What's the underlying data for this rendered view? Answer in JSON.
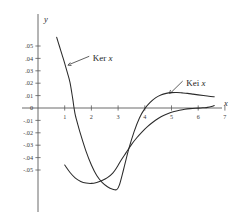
{
  "chart_data": {
    "type": "line",
    "title": "",
    "xlabel": "x",
    "ylabel": "y",
    "xlim": [
      0,
      7.6
    ],
    "ylim": [
      -0.068,
      0.062
    ],
    "grid": false,
    "legend": "annotations-with-arrows",
    "xticks": [
      1,
      2,
      3,
      4,
      5,
      6,
      7
    ],
    "xtick_labels": [
      "1",
      "2",
      "3",
      "4",
      "5",
      "6",
      "7"
    ],
    "yticks": [
      0.05,
      0.04,
      0.03,
      0.02,
      0.01,
      0,
      -0.01,
      -0.02,
      -0.03,
      -0.04,
      -0.05
    ],
    "ytick_labels": [
      ".05",
      ".04",
      ".03",
      ".02",
      ".01",
      "0",
      "-.01",
      "-.02",
      "-.03",
      "-.04",
      "-.05"
    ],
    "annotations": [
      {
        "text": "Ker x",
        "label_x": 2.05,
        "label_y": 0.0405,
        "arrow_to_x": 1.12,
        "arrow_to_y": 0.0345
      },
      {
        "text": "Kei x",
        "label_x": 5.55,
        "label_y": 0.0205,
        "arrow_to_x": 4.92,
        "arrow_to_y": 0.0118
      }
    ],
    "series": [
      {
        "name": "Ker x",
        "x": [
          0.7,
          0.8,
          0.9,
          1.0,
          1.1,
          1.2,
          1.3,
          1.35,
          1.4,
          1.5,
          1.6,
          1.8,
          2.0,
          2.2,
          2.4,
          2.6,
          2.8,
          2.95,
          3.05,
          3.2,
          3.4,
          3.6,
          3.8,
          4.0,
          4.2,
          4.4,
          4.6,
          4.8,
          5.0,
          5.2,
          5.4,
          5.6,
          5.8,
          6.0,
          6.2,
          6.4,
          6.6
        ],
        "y": [
          0.057,
          0.05,
          0.043,
          0.036,
          0.0285,
          0.0205,
          0.0075,
          0.0,
          -0.006,
          -0.014,
          -0.0215,
          -0.035,
          -0.046,
          -0.0545,
          -0.06,
          -0.0635,
          -0.0655,
          -0.0658,
          -0.062,
          -0.05,
          -0.033,
          -0.019,
          -0.008,
          -0.0005,
          0.0045,
          0.0082,
          0.0105,
          0.0118,
          0.0124,
          0.0125,
          0.0122,
          0.0118,
          0.0112,
          0.0106,
          0.01,
          0.0094,
          0.009
        ]
      },
      {
        "name": "Kei x",
        "x": [
          1.0,
          1.2,
          1.4,
          1.6,
          1.8,
          2.0,
          2.2,
          2.4,
          2.6,
          2.8,
          2.95,
          3.1,
          3.3,
          3.5,
          3.7,
          3.9,
          4.1,
          4.3,
          4.5,
          4.7,
          4.9,
          5.1,
          5.3,
          5.5,
          5.7,
          5.9,
          6.1,
          6.2,
          6.35,
          6.5,
          6.6
        ],
        "y": [
          -0.046,
          -0.052,
          -0.0565,
          -0.0592,
          -0.0605,
          -0.0608,
          -0.06,
          -0.0585,
          -0.0562,
          -0.0525,
          -0.048,
          -0.0425,
          -0.036,
          -0.0295,
          -0.024,
          -0.0192,
          -0.015,
          -0.0115,
          -0.0085,
          -0.006,
          -0.0042,
          -0.0028,
          -0.0018,
          -0.001,
          -0.0005,
          -0.0002,
          0.0,
          0.0002,
          0.0005,
          0.0012,
          0.002
        ]
      }
    ],
    "curve_color": "#2b2b2b",
    "axis_color": "#5a5a5a"
  },
  "figure": {
    "y_axis_label": "y",
    "x_axis_label": "x"
  }
}
